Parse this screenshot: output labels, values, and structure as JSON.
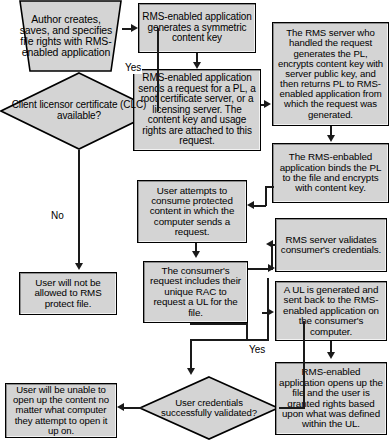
{
  "diagram": {
    "colors": {
      "node_fill": "#d4d4d4",
      "node_border": "#000000",
      "connector": "#1a1a1a",
      "background": "#ffffff",
      "text": "#000000"
    },
    "nodes": {
      "author_creates": {
        "shape": "trapezoid",
        "text": "Author creates, saves, and specifies file rights with RMS-enabled application"
      },
      "clc_available": {
        "shape": "diamond",
        "text": "Client licensor certificate (CLC) available?"
      },
      "generates_key": {
        "shape": "box",
        "text": "RMS-enabled application generates a symmetric content key"
      },
      "sends_request": {
        "shape": "box",
        "text": "RMS-enabled application sends a request for a PL, a root certificate server, or a licensing server. The content key and usage rights are attached to this request."
      },
      "rms_server_handles": {
        "shape": "box",
        "text": "The RMS server who handled the request generates the PL, encrypts content key with server public key, and then returns PL to RMS-enabled application from which the request was generated."
      },
      "binds_pl": {
        "shape": "box",
        "text": "The RMS-enbabled application binds the PL to the file and encrypts with content key."
      },
      "user_attempts": {
        "shape": "box",
        "text": "User attempts to consume protected content in which the computer sends a request."
      },
      "not_allowed": {
        "shape": "box",
        "text": "User will not be allowed to RMS protect file."
      },
      "consumer_request": {
        "shape": "box",
        "text": "The consumer's request includes their unique RAC to request a UL for the file."
      },
      "validates_credentials": {
        "shape": "box",
        "text": "RMS server validates consumer's credentials."
      },
      "ul_generated": {
        "shape": "box",
        "text": "A UL is generated and sent back to the RMS-enabled application on the consumer's computer."
      },
      "credentials_validated": {
        "shape": "diamond",
        "text": "User credentials successfully validated?"
      },
      "unable_to_open": {
        "shape": "box",
        "text": "User will be unable to open up the content no matter what computer they attempt to open it up on."
      },
      "opens_file": {
        "shape": "box",
        "text": "RMS-enabled application opens up the file and the user is granted rights based upon what was defined within the UL."
      }
    },
    "edge_labels": {
      "yes_top": "Yes",
      "no_left": "No",
      "yes_bottom": "Yes"
    }
  }
}
